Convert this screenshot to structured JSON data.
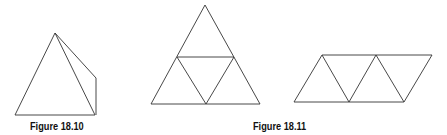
{
  "figures": [
    {
      "caption": "Figure 18.10",
      "description": "Tetrahedron / triangular pyramid drawn in perspective",
      "stroke_color": "#222222"
    },
    {
      "caption": "Figure 18.11",
      "description": "Net of a tetrahedron: large triangle divided into four smaller triangles, and a parallelogram strip of four triangles",
      "stroke_color": "#222222"
    }
  ]
}
